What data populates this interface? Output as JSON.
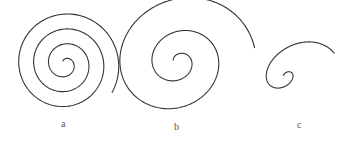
{
  "figure": {
    "panels": [
      {
        "label": "a",
        "type": "archimedean-spiral",
        "turns": 3.5
      },
      {
        "label": "b",
        "type": "spiral-expanding",
        "turns": 2.5
      },
      {
        "label": "c",
        "type": "logarithmic-spiral",
        "turns": 1.5
      }
    ],
    "stroke_color": "#333333",
    "background": "#ffffff"
  }
}
